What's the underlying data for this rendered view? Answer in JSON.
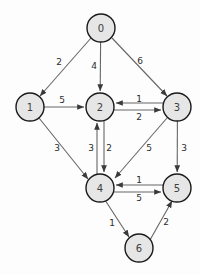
{
  "diagram": {
    "type": "directed-weighted-graph",
    "colors": {
      "node_fill": "#e6e6e6",
      "node_stroke": "#1a1a1a",
      "edge_stroke": "#666666",
      "label_text": "#2b2b2b",
      "background": "#fdfdfd"
    },
    "nodes": [
      {
        "id": "0",
        "label": "0",
        "cx": 101,
        "cy": 28,
        "r": 14
      },
      {
        "id": "1",
        "label": "1",
        "cx": 30,
        "cy": 107,
        "r": 14
      },
      {
        "id": "2",
        "label": "2",
        "cx": 100,
        "cy": 107,
        "r": 14
      },
      {
        "id": "3",
        "label": "3",
        "cx": 177,
        "cy": 107,
        "r": 14
      },
      {
        "id": "4",
        "label": "4",
        "cx": 100,
        "cy": 188,
        "r": 14
      },
      {
        "id": "5",
        "label": "5",
        "cx": 177,
        "cy": 188,
        "r": 14
      },
      {
        "id": "6",
        "label": "6",
        "cx": 139,
        "cy": 248,
        "r": 14
      }
    ],
    "edges": [
      {
        "from": "0",
        "to": "1",
        "weight": "2",
        "label_x": 59,
        "label_y": 62
      },
      {
        "from": "0",
        "to": "2",
        "weight": "4",
        "label_x": 94,
        "label_y": 66
      },
      {
        "from": "0",
        "to": "3",
        "weight": "6",
        "label_x": 140,
        "label_y": 61
      },
      {
        "from": "1",
        "to": "2",
        "weight": "5",
        "label_x": 62,
        "label_y": 100
      },
      {
        "from": "3",
        "to": "2",
        "weight": "1",
        "label_x": 139,
        "label_y": 99
      },
      {
        "from": "2",
        "to": "3",
        "weight": "2",
        "label_x": 139,
        "label_y": 117
      },
      {
        "from": "1",
        "to": "4",
        "weight": "3",
        "label_x": 57,
        "label_y": 148
      },
      {
        "from": "4",
        "to": "2",
        "weight": "3",
        "label_x": 91,
        "label_y": 148
      },
      {
        "from": "2",
        "to": "4",
        "weight": "2",
        "label_x": 109,
        "label_y": 148
      },
      {
        "from": "3",
        "to": "4",
        "weight": "5",
        "label_x": 149,
        "label_y": 148
      },
      {
        "from": "3",
        "to": "5",
        "weight": "3",
        "label_x": 184,
        "label_y": 148
      },
      {
        "from": "5",
        "to": "4",
        "weight": "1",
        "label_x": 139,
        "label_y": 180
      },
      {
        "from": "4",
        "to": "5",
        "weight": "5",
        "label_x": 139,
        "label_y": 198
      },
      {
        "from": "4",
        "to": "6",
        "weight": "1",
        "label_x": 112,
        "label_y": 223
      },
      {
        "from": "6",
        "to": "5",
        "weight": "2",
        "label_x": 166,
        "label_y": 222
      }
    ]
  }
}
